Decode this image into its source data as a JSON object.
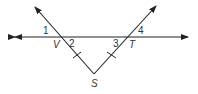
{
  "diagram": {
    "points": {
      "V": {
        "label": "V",
        "x": 59,
        "y": 37
      },
      "T": {
        "label": "T",
        "x": 129,
        "y": 37
      },
      "S": {
        "label": "S",
        "x": 94,
        "y": 74
      }
    },
    "angles": [
      {
        "label": "1"
      },
      {
        "label": "2"
      },
      {
        "label": "3"
      },
      {
        "label": "4"
      }
    ],
    "line_color": "#222222",
    "tick_marks": "SV ≅ ST"
  }
}
